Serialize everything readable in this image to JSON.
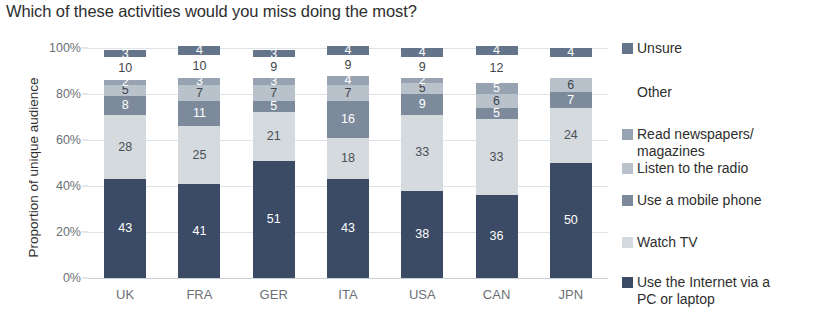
{
  "chart_data": {
    "type": "bar",
    "subtype": "stacked-bar-100-percent",
    "title": "Which of these activities would you miss doing the most?",
    "xlabel": "",
    "ylabel": "Proportion of unique audience",
    "ylim": [
      0,
      100
    ],
    "ytick_labels": [
      "0%",
      "20%",
      "40%",
      "60%",
      "80%",
      "100%"
    ],
    "ytick_values": [
      0,
      20,
      40,
      60,
      80,
      100
    ],
    "grid": true,
    "legend_position": "right",
    "categories": [
      "UK",
      "FRA",
      "GER",
      "ITA",
      "USA",
      "CAN",
      "JPN"
    ],
    "series": [
      {
        "name": "Use the Internet via a PC or laptop",
        "color": "#3b4a65",
        "label_color": "#ffffff",
        "values": [
          43,
          41,
          51,
          43,
          38,
          36,
          50
        ],
        "labels": [
          "43",
          "41",
          "51",
          "43",
          "38",
          "36",
          "50"
        ]
      },
      {
        "name": "Watch TV",
        "color": "#d4dade",
        "label_color": "#4a4f55",
        "values": [
          28,
          25,
          21,
          18,
          33,
          33,
          24
        ],
        "labels": [
          "28",
          "25",
          "21",
          "18",
          "33",
          "33",
          "24"
        ]
      },
      {
        "name": "Use a mobile phone",
        "color": "#7d8a9c",
        "label_color": "#ffffff",
        "values": [
          8,
          11,
          5,
          16,
          9,
          5,
          7
        ],
        "labels": [
          "8",
          "11",
          "5",
          "16",
          "9",
          "5",
          "7"
        ]
      },
      {
        "name": "Listen to the radio",
        "color": "#b9c2ca",
        "label_color": "#3f444a",
        "values": [
          5,
          7,
          7,
          7,
          5,
          6,
          6
        ],
        "labels": [
          "5",
          "7",
          "7",
          "7",
          "5",
          "6",
          "6"
        ]
      },
      {
        "name": "Read newspapers/ magazines",
        "color": "#97a3b1",
        "label_color": "#ffffff",
        "values": [
          2,
          3,
          3,
          4,
          2,
          5,
          0
        ],
        "labels": [
          "2",
          "3",
          "3",
          "4",
          "2",
          "5",
          ""
        ]
      },
      {
        "name": "Other",
        "color": "#ffffff",
        "label_color": "#3f444a",
        "values": [
          10,
          10,
          9,
          9,
          9,
          12,
          9
        ],
        "labels": [
          "10",
          "10",
          "9",
          "9",
          "9",
          "12",
          ""
        ]
      },
      {
        "name": "Unsure",
        "color": "#64748b",
        "label_color": "#ffffff",
        "values": [
          3,
          4,
          3,
          4,
          4,
          4,
          4
        ],
        "labels": [
          "3",
          "4",
          "3",
          "4",
          "4",
          "4",
          "4"
        ]
      }
    ],
    "legend_entries": [
      {
        "label": "Unsure",
        "color": "#64748b"
      },
      {
        "label": "Other",
        "color": "#ffffff"
      },
      {
        "label": "Read newspapers/\nmagazines",
        "color": "#97a3b1"
      },
      {
        "label": "Listen to the radio",
        "color": "#b9c2ca"
      },
      {
        "label": "Use a mobile phone",
        "color": "#7d8a9c"
      },
      {
        "label": "Watch TV",
        "color": "#d4dade"
      },
      {
        "label": "Use the Internet via a\nPC or laptop",
        "color": "#3b4a65"
      }
    ]
  },
  "colors": {
    "background": "#ffffff",
    "grid": "#dfe3e8",
    "axis_text": "#6b7075",
    "title_text": "#2e2e2e"
  }
}
